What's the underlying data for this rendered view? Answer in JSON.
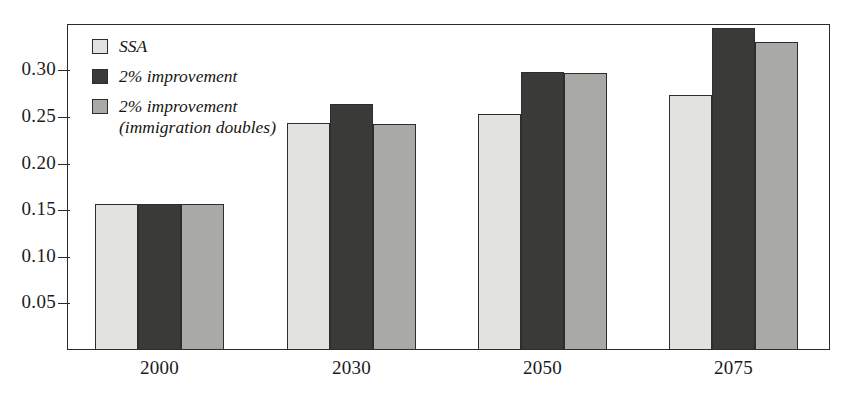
{
  "chart_data": {
    "type": "bar",
    "title": "",
    "subtitle": "",
    "xlabel": "",
    "ylabel": "",
    "categories": [
      "2000",
      "2030",
      "2050",
      "2075"
    ],
    "series": [
      {
        "name": "SSA",
        "color": "#e2e2df",
        "values": [
          0.157,
          0.244,
          0.253,
          0.274
        ]
      },
      {
        "name": "2% improvement",
        "color": "#3a3a38",
        "values": [
          0.157,
          0.264,
          0.298,
          0.346
        ]
      },
      {
        "name": "2% improvement\n(immigration doubles)",
        "color": "#a9a9a6",
        "values": [
          0.157,
          0.242,
          0.297,
          0.331
        ]
      }
    ],
    "ylim": [
      0.0,
      0.35
    ],
    "yticks": [
      0.05,
      0.1,
      0.15,
      0.2,
      0.25,
      0.3
    ],
    "ytick_labels": [
      "0.05",
      "0.10",
      "0.15",
      "0.20",
      "0.25",
      "0.30"
    ],
    "grid": false,
    "legend_position": "top-left",
    "frame": true
  },
  "legend": {
    "entries": [
      {
        "label": "SSA",
        "color": "#e2e2df"
      },
      {
        "label": "2% improvement",
        "color": "#3a3a38"
      },
      {
        "label": "2% improvement\n(immigration doubles)",
        "color": "#a9a9a6"
      }
    ]
  },
  "axis": {
    "y_tick_labels": [
      "0.30",
      "0.25",
      "0.20",
      "0.15",
      "0.10",
      "0.05"
    ],
    "x_tick_labels": [
      "2000",
      "2030",
      "2050",
      "2075"
    ]
  },
  "colors": {
    "series_light": "#e2e2df",
    "series_dark": "#3a3a38",
    "series_medium": "#a9a9a6",
    "axis": "#2a2a2a",
    "background": "#ffffff"
  }
}
